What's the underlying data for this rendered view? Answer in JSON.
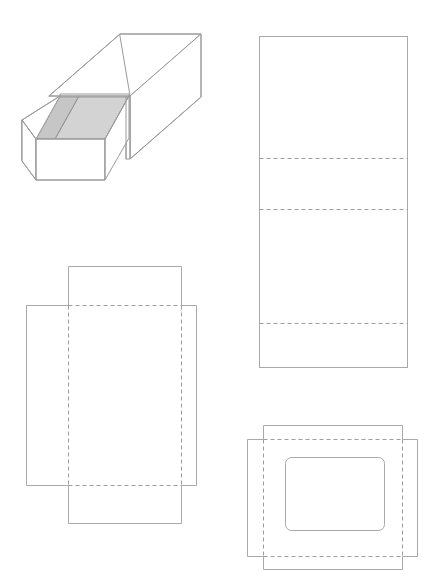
{
  "document": {
    "title": "Matchbox Packaging Dieline Sheet",
    "background_color": "#ffffff",
    "width": 441,
    "height": 587
  },
  "style": {
    "cut_line_color": "#a9a9a9",
    "fold_line_color": "#9d9d9d",
    "iso_line_color": "#9a9a9a",
    "drawer_top_fill": "#d3d3d3",
    "drawer_top_fill_shadow": "#c6c6c6",
    "face_fill": "#ffffff",
    "fold_dash_pattern": "4 3",
    "stroke_width": 1
  },
  "figures": [
    {
      "id": "iso-view",
      "name": "isometric-matchbox-view",
      "label": "Matchbox assembled, drawer partially open",
      "type": "isometric-3d",
      "components": [
        "outer-sleeve",
        "inner-drawer",
        "drawer-top-panel",
        "drawer-divider"
      ]
    },
    {
      "id": "sleeve-dieline",
      "name": "sleeve-dieline",
      "label": "Outer sleeve flat dieline",
      "type": "dieline",
      "outline": {
        "x": 259,
        "y": 36,
        "width": 149,
        "height": 332
      },
      "fold_lines": [
        {
          "orientation": "horizontal",
          "y": 158
        },
        {
          "orientation": "horizontal",
          "y": 209
        },
        {
          "orientation": "horizontal",
          "y": 323
        }
      ],
      "panel_count": 4
    },
    {
      "id": "tray-dieline",
      "name": "tray-dieline",
      "label": "Inner drawer tray flat dieline",
      "type": "dieline",
      "shape": "cross",
      "base_panel": {
        "x": 68,
        "y": 305,
        "width": 114,
        "height": 180
      },
      "fold_lines": [
        {
          "orientation": "vertical",
          "x": 68
        },
        {
          "orientation": "vertical",
          "x": 182
        },
        {
          "orientation": "horizontal",
          "y": 305
        },
        {
          "orientation": "horizontal",
          "y": 485
        }
      ],
      "flap_count": 4
    },
    {
      "id": "window-dieline",
      "name": "window-panel-dieline",
      "label": "Lid panel dieline with window cutout",
      "type": "dieline",
      "shape": "cross",
      "outline": {
        "x": 247,
        "y": 425,
        "width": 171,
        "height": 145
      },
      "window_cutout": {
        "x": 285,
        "y": 457,
        "width": 100,
        "height": 74,
        "corner_radius": 6
      },
      "fold_lines": [
        {
          "orientation": "vertical",
          "x": 263
        },
        {
          "orientation": "vertical",
          "x": 402
        },
        {
          "orientation": "horizontal",
          "y": 439
        },
        {
          "orientation": "horizontal",
          "y": 556
        }
      ]
    }
  ]
}
